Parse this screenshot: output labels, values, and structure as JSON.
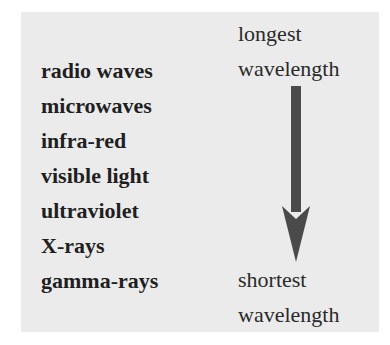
{
  "diagram": {
    "items": [
      "radio waves",
      "microwaves",
      "infra-red",
      "visible light",
      "ultraviolet",
      "X-rays",
      "gamma-rays"
    ],
    "top_label": {
      "line1": "longest",
      "line2": "wavelength"
    },
    "bottom_label": {
      "line1": "shortest",
      "line2": "wavelength"
    },
    "arrow": {
      "direction": "down",
      "color": "#4a4a4a"
    },
    "colors": {
      "panel": "#ebebeb",
      "text": "#1f1f1f"
    }
  }
}
